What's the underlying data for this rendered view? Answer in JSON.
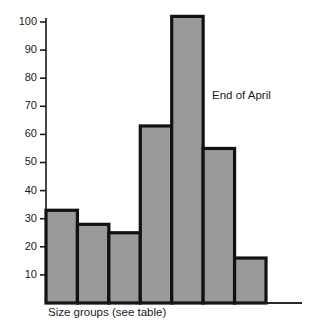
{
  "chart_data": {
    "type": "bar",
    "title": "",
    "subtitle": "",
    "xlabel": "Size groups (see table)",
    "ylabel": "",
    "categories": [
      "1",
      "2",
      "3",
      "4",
      "5",
      "6",
      "7"
    ],
    "values": [
      33,
      28,
      25,
      63,
      102,
      55,
      16
    ],
    "series": [
      {
        "name": "End of April",
        "values": [
          33,
          28,
          25,
          63,
          102,
          55,
          16
        ]
      }
    ],
    "ylim": [
      0,
      105
    ],
    "yticks": [
      10,
      20,
      30,
      40,
      50,
      60,
      70,
      80,
      90,
      100
    ],
    "ytick_labels": [
      "10",
      "20",
      "30",
      "40",
      "50",
      "60",
      "70",
      "80",
      "90",
      "100"
    ],
    "xticks": [],
    "xtick_labels": [],
    "grid": false,
    "legend": false,
    "legend_position": "none",
    "annotations": [
      {
        "text": "End of April",
        "x_px": 212,
        "y_px": 96
      }
    ],
    "colors": {
      "bar_fill": "#9a9a9a",
      "bar_edge": "#111111",
      "axis": "#1a1a1a",
      "text": "#1a1a1a",
      "background": "#ffffff"
    },
    "style": {
      "bars_contiguous": true,
      "bar_edge_width_px": 3.2,
      "axis_baseline_extends_past_bars": true
    }
  },
  "axis": {
    "y_tick_labels": [
      "100",
      "90",
      "80",
      "70",
      "60",
      "50",
      "40",
      "30",
      "20",
      "10"
    ],
    "x_caption": "Size groups (see table)"
  },
  "annotation": {
    "label": "End of April"
  }
}
